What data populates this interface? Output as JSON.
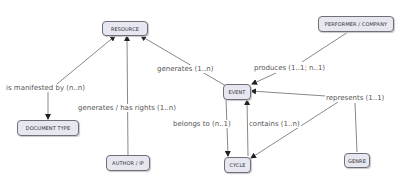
{
  "diagram": {
    "type": "concept-map",
    "nodes": {
      "resource": "RESOURCE",
      "performer": "PERFORMER / COMPANY",
      "event": "EVENT",
      "document_type": "DOCUMENT TYPE",
      "author": "AUTHOR / IP",
      "cycle": "CYCLE",
      "genre": "GENRE"
    },
    "edges": {
      "manifested": "is manifested by (n..n)",
      "generates": "generates (1..n)",
      "produces": "produces (1..1; n..1)",
      "rights": "generates / has rights (1..n)",
      "belongs": "belongs to (n..1)",
      "contains": "contains (1..n)",
      "represents": "represents (1..1)"
    },
    "colors": {
      "node_fill": "#e6e7f0",
      "node_border": "#6f6f78",
      "edge": "#555555"
    }
  }
}
